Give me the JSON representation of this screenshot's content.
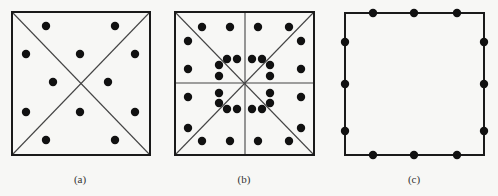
{
  "figure": {
    "panels": [
      {
        "id": "a",
        "caption": "(a)",
        "caption_pos": [
          80,
          173
        ],
        "square": {
          "x1": 12,
          "y1": 12,
          "x2": 150,
          "y2": 155
        },
        "lines": [
          {
            "x1": 12,
            "y1": 12,
            "x2": 150,
            "y2": 155
          },
          {
            "x1": 150,
            "y1": 12,
            "x2": 12,
            "y2": 155
          }
        ],
        "dots": [
          [
            46,
            26
          ],
          [
            115,
            26
          ],
          [
            26,
            54
          ],
          [
            80,
            54
          ],
          [
            135,
            54
          ],
          [
            53,
            82
          ],
          [
            108,
            82
          ],
          [
            26,
            112
          ],
          [
            80,
            112
          ],
          [
            135,
            112
          ],
          [
            46,
            140
          ],
          [
            115,
            140
          ]
        ]
      },
      {
        "id": "b",
        "caption": "(b)",
        "caption_pos": [
          244,
          173
        ],
        "square": {
          "x1": 175,
          "y1": 12,
          "x2": 314,
          "y2": 155
        },
        "lines": [
          {
            "x1": 175,
            "y1": 12,
            "x2": 314,
            "y2": 155
          },
          {
            "x1": 314,
            "y1": 12,
            "x2": 175,
            "y2": 155
          },
          {
            "x1": 245,
            "y1": 12,
            "x2": 245,
            "y2": 155
          },
          {
            "x1": 175,
            "y1": 83,
            "x2": 314,
            "y2": 83
          }
        ],
        "dots": [
          [
            202,
            27
          ],
          [
            230,
            27
          ],
          [
            258,
            27
          ],
          [
            289,
            27
          ],
          [
            188,
            41
          ],
          [
            301,
            41
          ],
          [
            188,
            69
          ],
          [
            301,
            69
          ],
          [
            188,
            97
          ],
          [
            301,
            97
          ],
          [
            188,
            128
          ],
          [
            301,
            128
          ],
          [
            202,
            141
          ],
          [
            230,
            141
          ],
          [
            258,
            141
          ],
          [
            289,
            141
          ],
          [
            227,
            59
          ],
          [
            237,
            59
          ],
          [
            252,
            59
          ],
          [
            262,
            59
          ],
          [
            219,
            65
          ],
          [
            219,
            76
          ],
          [
            219,
            93
          ],
          [
            219,
            103
          ],
          [
            270,
            65
          ],
          [
            270,
            76
          ],
          [
            270,
            93
          ],
          [
            270,
            103
          ],
          [
            227,
            109
          ],
          [
            237,
            109
          ],
          [
            252,
            109
          ],
          [
            262,
            109
          ]
        ]
      },
      {
        "id": "c",
        "caption": "(c)",
        "caption_pos": [
          414,
          173
        ],
        "square": {
          "x1": 345,
          "y1": 13,
          "x2": 484,
          "y2": 155
        },
        "lines": [],
        "dots": [
          [
            373,
            13
          ],
          [
            414,
            13
          ],
          [
            457,
            13
          ],
          [
            373,
            155
          ],
          [
            414,
            155
          ],
          [
            457,
            155
          ],
          [
            345,
            42
          ],
          [
            345,
            84
          ],
          [
            345,
            131
          ],
          [
            484,
            42
          ],
          [
            484,
            84
          ],
          [
            484,
            131
          ]
        ]
      }
    ],
    "dot_radius": 4.2,
    "colors": {
      "stroke": "#1a1a1a",
      "diagonal": "#444444",
      "dot": "#111111",
      "background": "#f7f7f5"
    }
  }
}
